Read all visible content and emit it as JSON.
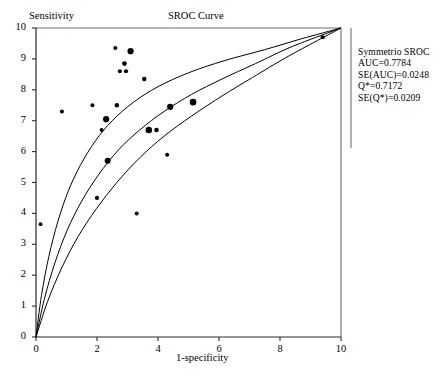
{
  "chart_data": {
    "type": "scatter",
    "title": "SROC Curve",
    "xlabel": "1-specificity",
    "ylabel": "Sensitivity",
    "xlim": [
      0,
      10
    ],
    "ylim": [
      0,
      10
    ],
    "grid": false,
    "xticks": [
      0,
      2,
      4,
      6,
      8,
      10
    ],
    "yticks": [
      0,
      1,
      2,
      3,
      4,
      5,
      6,
      7,
      8,
      9,
      10
    ],
    "xtick_labels": [
      "0",
      "2",
      "4",
      "6",
      "8",
      "10"
    ],
    "ytick_labels": [
      "0",
      "1",
      "2",
      "3",
      "4",
      "5",
      "6",
      "7",
      "8",
      "9",
      "10"
    ],
    "legend_position": "right-outside",
    "series": [
      {
        "name": "Studies",
        "type": "scatter",
        "marker": "filled-circle",
        "note": "marker radius encodes study weight",
        "points": [
          {
            "x": 0.15,
            "y": 3.65,
            "r": 1.9
          },
          {
            "x": 0.85,
            "y": 7.3,
            "r": 2.0
          },
          {
            "x": 1.85,
            "y": 7.5,
            "r": 2.0
          },
          {
            "x": 2.0,
            "y": 4.5,
            "r": 2.1
          },
          {
            "x": 2.15,
            "y": 6.7,
            "r": 2.0
          },
          {
            "x": 2.3,
            "y": 7.05,
            "r": 3.1
          },
          {
            "x": 2.35,
            "y": 5.7,
            "r": 3.0
          },
          {
            "x": 2.6,
            "y": 9.35,
            "r": 2.0
          },
          {
            "x": 2.65,
            "y": 7.5,
            "r": 2.2
          },
          {
            "x": 2.75,
            "y": 8.6,
            "r": 2.0
          },
          {
            "x": 2.9,
            "y": 8.85,
            "r": 2.4
          },
          {
            "x": 2.95,
            "y": 8.6,
            "r": 2.1
          },
          {
            "x": 3.1,
            "y": 9.25,
            "r": 3.1
          },
          {
            "x": 3.3,
            "y": 4.0,
            "r": 2.0
          },
          {
            "x": 3.55,
            "y": 8.35,
            "r": 2.2
          },
          {
            "x": 3.7,
            "y": 6.7,
            "r": 3.2
          },
          {
            "x": 3.95,
            "y": 6.7,
            "r": 2.3
          },
          {
            "x": 4.3,
            "y": 5.9,
            "r": 2.0
          },
          {
            "x": 4.4,
            "y": 7.45,
            "r": 3.1
          },
          {
            "x": 5.15,
            "y": 7.6,
            "r": 3.3
          },
          {
            "x": 9.4,
            "y": 9.7,
            "r": 2.1
          }
        ]
      },
      {
        "name": "Upper confidence band",
        "type": "line",
        "points": [
          {
            "x": 0.0,
            "y": 0.0
          },
          {
            "x": 0.18,
            "y": 1.35
          },
          {
            "x": 0.42,
            "y": 2.6
          },
          {
            "x": 0.72,
            "y": 3.75
          },
          {
            "x": 1.05,
            "y": 4.7
          },
          {
            "x": 1.45,
            "y": 5.55
          },
          {
            "x": 1.95,
            "y": 6.35
          },
          {
            "x": 2.5,
            "y": 7.0
          },
          {
            "x": 3.2,
            "y": 7.6
          },
          {
            "x": 4.0,
            "y": 8.1
          },
          {
            "x": 5.0,
            "y": 8.55
          },
          {
            "x": 6.2,
            "y": 8.95
          },
          {
            "x": 7.5,
            "y": 9.3
          },
          {
            "x": 8.7,
            "y": 9.65
          },
          {
            "x": 10.0,
            "y": 10.0
          }
        ]
      },
      {
        "name": "Fitted SROC curve",
        "type": "line",
        "points": [
          {
            "x": 0.0,
            "y": 0.0
          },
          {
            "x": 0.28,
            "y": 1.25
          },
          {
            "x": 0.62,
            "y": 2.4
          },
          {
            "x": 1.02,
            "y": 3.45
          },
          {
            "x": 1.5,
            "y": 4.4
          },
          {
            "x": 2.05,
            "y": 5.25
          },
          {
            "x": 2.7,
            "y": 6.05
          },
          {
            "x": 3.4,
            "y": 6.7
          },
          {
            "x": 4.2,
            "y": 7.3
          },
          {
            "x": 5.1,
            "y": 7.85
          },
          {
            "x": 6.1,
            "y": 8.35
          },
          {
            "x": 7.2,
            "y": 8.85
          },
          {
            "x": 8.4,
            "y": 9.4
          },
          {
            "x": 10.0,
            "y": 10.0
          }
        ]
      },
      {
        "name": "Lower confidence band",
        "type": "line",
        "points": [
          {
            "x": 0.0,
            "y": 0.0
          },
          {
            "x": 0.38,
            "y": 1.15
          },
          {
            "x": 0.85,
            "y": 2.25
          },
          {
            "x": 1.38,
            "y": 3.25
          },
          {
            "x": 1.98,
            "y": 4.15
          },
          {
            "x": 2.65,
            "y": 5.0
          },
          {
            "x": 3.4,
            "y": 5.8
          },
          {
            "x": 4.2,
            "y": 6.5
          },
          {
            "x": 5.1,
            "y": 7.15
          },
          {
            "x": 6.1,
            "y": 7.8
          },
          {
            "x": 7.1,
            "y": 8.4
          },
          {
            "x": 8.3,
            "y": 9.1
          },
          {
            "x": 10.0,
            "y": 10.0
          }
        ]
      }
    ],
    "annotations": {
      "panel_title": "Symmetrio SROC",
      "lines": [
        "AUC=0.7784",
        "SE(AUC)=0.0248",
        "Q*=0.7172",
        "SE(Q*)=0.0209"
      ]
    }
  },
  "stats": {
    "title": "Symmetrio SROC",
    "auc": "AUC=0.7784",
    "se_auc": "SE(AUC)=0.0248",
    "q_star": "Q*=0.7172",
    "se_q_star": "SE(Q*)=0.0209"
  },
  "labels": {
    "chart_title": "SROC Curve",
    "y_axis_title": "Sensitivity",
    "x_axis_title": "1-specificity"
  }
}
